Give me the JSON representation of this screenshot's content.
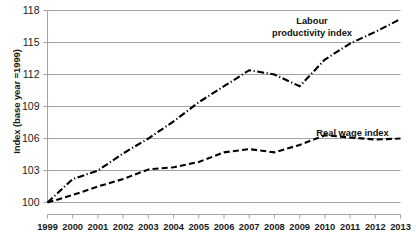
{
  "chart_data": {
    "type": "line",
    "title": "",
    "xlabel": "",
    "ylabel": "Index (base year =1999)",
    "ylim": [
      100,
      118
    ],
    "yticks": [
      100,
      103,
      106,
      109,
      112,
      115,
      118
    ],
    "ytick_labels": [
      "100",
      "103",
      "106",
      "109",
      "112",
      "115",
      "118"
    ],
    "grid": true,
    "legend_position": "inline-annotations",
    "x": [
      1999,
      2000,
      2001,
      2002,
      2003,
      2004,
      2005,
      2006,
      2007,
      2008,
      2009,
      2010,
      2011,
      2012,
      2013
    ],
    "xtick_labels": [
      "1999",
      "2000",
      "2001",
      "2002",
      "2003",
      "2004",
      "2005",
      "2006",
      "2007",
      "2008",
      "2009",
      "2010",
      "2011",
      "2012",
      "2013"
    ],
    "series": [
      {
        "name": "Labour productivity index",
        "style": "dash-dot",
        "color": "#000000",
        "values": [
          100.0,
          102.2,
          103.0,
          104.6,
          106.0,
          107.6,
          109.4,
          110.9,
          112.4,
          112.0,
          110.9,
          113.4,
          114.9,
          116.0,
          117.2
        ]
      },
      {
        "name": "Real wage index",
        "style": "dashed",
        "color": "#000000",
        "values": [
          100.0,
          100.7,
          101.5,
          102.2,
          103.1,
          103.3,
          103.8,
          104.7,
          105.0,
          104.7,
          105.4,
          106.3,
          106.1,
          105.9,
          106.0
        ]
      }
    ],
    "annotations": [
      {
        "id": "labour-productivity",
        "text": "Labour\nproductivity index"
      },
      {
        "id": "real-wage",
        "text": "Real wage index"
      }
    ]
  },
  "colors": {
    "grid": "#9a9a9a",
    "axis": "#9a9a9a",
    "line": "#000000",
    "text": "#1a1a1a"
  }
}
